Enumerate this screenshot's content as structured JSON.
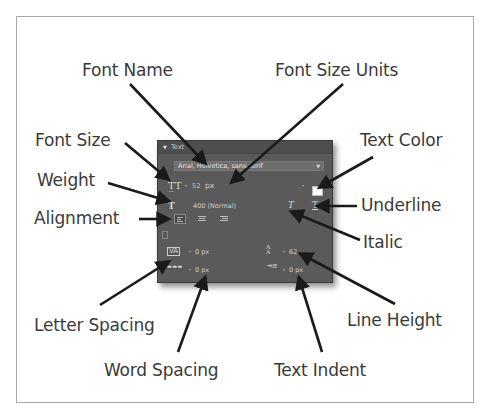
{
  "diagram": {
    "labels": {
      "font_name": "Font Name",
      "font_size_units": "Font Size Units",
      "font_size": "Font Size",
      "weight": "Weight",
      "alignment": "Alignment",
      "text_color": "Text Color",
      "underline": "Underline",
      "italic": "Italic",
      "letter_spacing": "Letter Spacing",
      "word_spacing": "Word Spacing",
      "line_height": "Line Height",
      "text_indent": "Text Indent"
    }
  },
  "panel": {
    "title": "Text",
    "collapse_icon": "triangle-down-icon",
    "font_family": "Arial, Helvetica, sans-serif",
    "font_size_value": "52",
    "font_size_unit": "px",
    "weight_value": "400 (Normal)",
    "text_color": "#ffffff",
    "letter_spacing": "0 px",
    "word_spacing": "0 px",
    "line_height": "62",
    "text_indent": "0 px",
    "alignment_options": [
      "left",
      "center",
      "right"
    ],
    "alignment_selected": "left"
  }
}
